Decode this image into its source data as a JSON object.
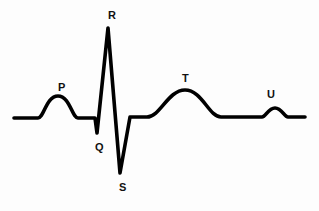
{
  "figure": {
    "name": "ecg-waveform-diagram",
    "background_color": "#fdfdfd",
    "stroke_color": "#000000",
    "label_color": "#111111",
    "width": 319,
    "height": 211
  },
  "labels": [
    {
      "id": "p",
      "text": "P",
      "x": 58,
      "y": 82
    },
    {
      "id": "q",
      "text": "Q",
      "x": 95,
      "y": 142
    },
    {
      "id": "r",
      "text": "R",
      "x": 108,
      "y": 10
    },
    {
      "id": "s",
      "text": "S",
      "x": 119,
      "y": 182
    },
    {
      "id": "t",
      "text": "T",
      "x": 182,
      "y": 73
    },
    {
      "id": "u",
      "text": "U",
      "x": 267,
      "y": 89
    }
  ],
  "chart_data": {
    "type": "line",
    "title": "",
    "xlabel": "",
    "ylabel": "",
    "xlim": [
      0,
      319
    ],
    "ylim": [
      211,
      0
    ],
    "grid": false,
    "legend": null,
    "baseline_y": 118,
    "annotations": [
      {
        "label": "P",
        "x": 58,
        "y": 96,
        "description": "P wave - atrial depolarization"
      },
      {
        "label": "Q",
        "x": 97,
        "y": 133,
        "description": "Q wave - small downward deflection"
      },
      {
        "label": "R",
        "x": 108,
        "y": 28,
        "description": "R wave - tall upward spike"
      },
      {
        "label": "S",
        "x": 120,
        "y": 173,
        "description": "S wave - deep downward deflection"
      },
      {
        "label": "T",
        "x": 185,
        "y": 90,
        "description": "T wave - ventricular repolarization"
      },
      {
        "label": "U",
        "x": 275,
        "y": 108,
        "description": "U wave - small late deflection"
      }
    ],
    "path": "M 14 118 L 38 118 C 44 118 46 96 58 96 C 70 96 72 118 78 118 L 95 118 L 97 133 L 108 28 L 120 173 L 130 117 L 147 117 C 160 117 168 90 185 90 C 202 90 209 117 221 117 L 262 117 C 266 117 268 108 275 108 C 282 108 284 117 288 117 L 305 117"
  }
}
